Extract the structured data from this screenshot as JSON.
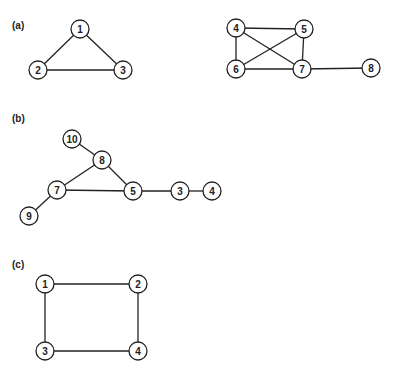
{
  "node_radius": 9,
  "panels": [
    {
      "label": "(a)",
      "label_pos": [
        12,
        29
      ],
      "graphs": [
        {
          "nodes": [
            {
              "id": "1",
              "x": 80,
              "y": 29
            },
            {
              "id": "2",
              "x": 38,
              "y": 70
            },
            {
              "id": "3",
              "x": 123,
              "y": 70
            }
          ],
          "edges": [
            [
              "1",
              "2"
            ],
            [
              "1",
              "3"
            ],
            [
              "2",
              "3"
            ]
          ]
        },
        {
          "nodes": [
            {
              "id": "4",
              "x": 236,
              "y": 28
            },
            {
              "id": "5",
              "x": 304,
              "y": 29
            },
            {
              "id": "6",
              "x": 236,
              "y": 69
            },
            {
              "id": "7",
              "x": 302,
              "y": 69
            },
            {
              "id": "8",
              "x": 371,
              "y": 68
            }
          ],
          "edges": [
            [
              "4",
              "5"
            ],
            [
              "4",
              "6"
            ],
            [
              "4",
              "7"
            ],
            [
              "5",
              "6"
            ],
            [
              "5",
              "7"
            ],
            [
              "6",
              "7"
            ],
            [
              "7",
              "8"
            ]
          ]
        }
      ]
    },
    {
      "label": "(b)",
      "label_pos": [
        12,
        122
      ],
      "graphs": [
        {
          "nodes": [
            {
              "id": "10",
              "x": 72,
              "y": 139
            },
            {
              "id": "8",
              "x": 102,
              "y": 160
            },
            {
              "id": "7",
              "x": 57,
              "y": 190
            },
            {
              "id": "5",
              "x": 133,
              "y": 191
            },
            {
              "id": "3",
              "x": 180,
              "y": 191
            },
            {
              "id": "4",
              "x": 212,
              "y": 191
            },
            {
              "id": "9",
              "x": 29,
              "y": 216
            }
          ],
          "edges": [
            [
              "10",
              "8"
            ],
            [
              "8",
              "7"
            ],
            [
              "8",
              "5"
            ],
            [
              "7",
              "5"
            ],
            [
              "7",
              "9"
            ],
            [
              "5",
              "3"
            ],
            [
              "3",
              "4"
            ]
          ]
        }
      ]
    },
    {
      "label": "(c)",
      "label_pos": [
        12,
        268
      ],
      "graphs": [
        {
          "nodes": [
            {
              "id": "1",
              "x": 45,
              "y": 284
            },
            {
              "id": "2",
              "x": 138,
              "y": 284
            },
            {
              "id": "3",
              "x": 45,
              "y": 351
            },
            {
              "id": "4",
              "x": 138,
              "y": 351
            }
          ],
          "edges": [
            [
              "1",
              "2"
            ],
            [
              "1",
              "3"
            ],
            [
              "2",
              "4"
            ],
            [
              "3",
              "4"
            ]
          ]
        }
      ]
    }
  ]
}
